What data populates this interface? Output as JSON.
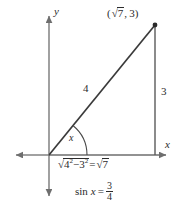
{
  "figure": {
    "type": "geometry-diagram",
    "colors": {
      "ink": "#2b2b2b",
      "axis": "#6e6e6e",
      "background": "#ffffff"
    },
    "axes": {
      "y_label": "y",
      "x_label": "x",
      "origin": {
        "x": 49,
        "y": 155
      },
      "x_axis": {
        "from_x": 12,
        "to_x": 170,
        "y": 155
      },
      "y_axis": {
        "x": 49,
        "from_y": 12,
        "to_y": 200
      },
      "arrows": [
        "x-left",
        "x-right",
        "y-up",
        "y-down"
      ]
    },
    "triangle": {
      "vertices": {
        "origin": {
          "x": 49,
          "y": 155
        },
        "foot": {
          "x": 155,
          "y": 155
        },
        "apex": {
          "x": 155,
          "y": 25
        }
      },
      "apex_point_marker": true
    },
    "labels": {
      "point_coordinate": "(√7, 3)",
      "hypotenuse": "4",
      "opposite_side": "3",
      "angle": "x"
    },
    "angle_arc": {
      "center": {
        "x": 49,
        "y": 155
      },
      "radius": 38,
      "from_deg": 0,
      "to_deg": 51
    },
    "equations": {
      "base_length": {
        "full_text": "√(4² − 3²) = √7",
        "radicand_base": "4",
        "radicand_base_exp": "2",
        "minus": "−",
        "radicand_sub": "3",
        "radicand_sub_exp": "2",
        "equals": "=",
        "result_radical": "7"
      },
      "sine": {
        "full_text": "sin x = 3/4",
        "function": "sin",
        "variable": "x",
        "equals": "=",
        "numerator": "3",
        "denominator": "4"
      }
    }
  }
}
